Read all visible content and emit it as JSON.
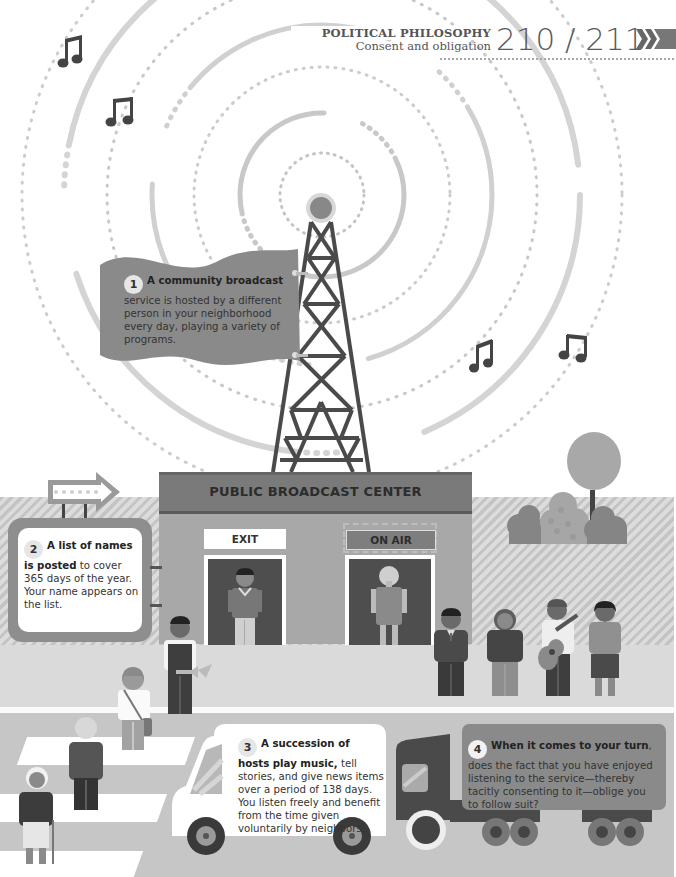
{
  "header": {
    "section": "POLITICAL PHILOSOPHY",
    "subsection": "Consent and obligation",
    "page_numbers": "210 / 211",
    "nav_icon": "double-chevron-right-icon"
  },
  "steps": [
    {
      "number": "1",
      "bold": "A community broadcast",
      "text": "service is hosted by a different person in your neighborhood every day, playing a variety of programs."
    },
    {
      "number": "2",
      "bold": "A list of names is posted",
      "text": "to cover 365 days of the year. Your name appears on the list."
    },
    {
      "number": "3",
      "bold": "A succession of hosts play music,",
      "text": "tell stories, and give news items over a period of 138 days. You listen freely and benefit from the time given voluntarily by neighbors."
    },
    {
      "number": "4",
      "bold": "When it comes to your turn",
      "text": ", does the fact that you have enjoyed listening to the service—thereby tacitly consenting to it—oblige you to follow suit?"
    }
  ],
  "building": {
    "sign": "PUBLIC BROADCAST CENTER",
    "door_left_sign": "EXIT",
    "door_right_sign": "ON AIR"
  },
  "colors": {
    "dark": "#4a4a4a",
    "mid": "#7a7a7a",
    "light": "#bdbdbd",
    "ground": "#d9d9d9",
    "road": "#c8c8c8",
    "building": "#a8a8a8"
  }
}
